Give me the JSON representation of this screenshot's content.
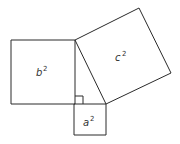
{
  "diagram": {
    "colors": {
      "stroke": "#2a2a2a",
      "text": "#333333",
      "background": "#ffffff"
    },
    "squares": [
      {
        "id": "b",
        "base": "b",
        "exponent": "2",
        "points": "11,40 75,40 75,104 11,104"
      },
      {
        "id": "a",
        "base": "a",
        "exponent": "2",
        "points": "74,104 106,104 106,135 74,135"
      },
      {
        "id": "c",
        "base": "c",
        "exponent": "2",
        "points": "75,40 139,8 171,73 106,104"
      }
    ],
    "triangle": {
      "points": "75,40 106,104 75,104"
    },
    "right_angle_marker": {
      "points": "75,96 83,96 83,104"
    },
    "labels": {
      "b": {
        "base": "b",
        "exponent": "2"
      },
      "a": {
        "base": "a",
        "exponent": "2"
      },
      "c": {
        "base": "c",
        "exponent": "2"
      }
    }
  }
}
